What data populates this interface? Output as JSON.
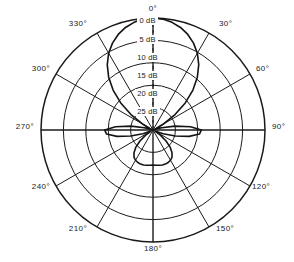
{
  "chart_data": {
    "type": "line",
    "subtype": "polar-radiation-pattern",
    "title": "",
    "xlabel": "",
    "ylabel": "",
    "grid": true,
    "legend": null,
    "center": {
      "x": 153,
      "y": 130
    },
    "outer_radius": 112,
    "angle_unit": "degrees",
    "angle_zero_position": "top",
    "angle_direction": "clockwise",
    "angle_ticks": [
      0,
      30,
      60,
      90,
      120,
      150,
      180,
      210,
      240,
      270,
      300,
      330
    ],
    "angle_tick_labels": [
      "0°",
      "30°",
      "60°",
      "90°",
      "120°",
      "150°",
      "180°",
      "210°",
      "240°",
      "270°",
      "300°",
      "330°"
    ],
    "radial_ticks_db": [
      0,
      5,
      10,
      15,
      20,
      25
    ],
    "radial_tick_labels": [
      "0 dB",
      "5 dB",
      "10 dB",
      "15 dB",
      "20 dB",
      "25 dB"
    ],
    "radial_scale_note": "0 dB at outer circle, 25 dB at center; value increases inward (attenuation below peak)",
    "rlim_db": [
      0,
      25
    ],
    "grid_circle_count": 6,
    "spoke_count": 12,
    "series": [
      {
        "name": "pattern",
        "angles": [
          0,
          5,
          10,
          15,
          20,
          25,
          30,
          35,
          40,
          45,
          50,
          55,
          60,
          65,
          70,
          75,
          80,
          85,
          90,
          95,
          100,
          105,
          110,
          115,
          120,
          125,
          130,
          135,
          140,
          145,
          150,
          155,
          160,
          165,
          170,
          175,
          180,
          185,
          190,
          195,
          200,
          205,
          210,
          215,
          220,
          225,
          230,
          235,
          240,
          245,
          250,
          255,
          260,
          265,
          270,
          275,
          280,
          285,
          290,
          295,
          300,
          305,
          310,
          315,
          320,
          325,
          330,
          335,
          340,
          345,
          350,
          355
        ],
        "values_db": [
          0.0,
          0.15,
          0.6,
          1.3,
          2.3,
          3.6,
          5.2,
          7.2,
          9.6,
          12.4,
          15.6,
          19.0,
          22.2,
          24.2,
          24.6,
          23.0,
          20.0,
          16.6,
          14.2,
          14.6,
          16.8,
          19.8,
          22.6,
          24.3,
          24.4,
          23.0,
          21.2,
          19.6,
          18.4,
          17.6,
          17.2,
          17.0,
          16.9,
          16.9,
          17.0,
          17.1,
          17.2,
          17.1,
          17.0,
          16.9,
          16.9,
          17.0,
          17.2,
          17.6,
          18.4,
          19.6,
          21.2,
          23.0,
          24.4,
          24.3,
          22.6,
          19.8,
          16.8,
          14.6,
          14.2,
          16.6,
          20.0,
          23.0,
          24.6,
          24.2,
          22.2,
          19.0,
          15.6,
          12.4,
          9.6,
          7.2,
          5.2,
          3.6,
          2.3,
          1.3,
          0.6,
          0.15
        ]
      }
    ],
    "features": {
      "main_lobe_direction_deg": 0,
      "main_lobe_peak_db": 0,
      "main_lobe_half_power_beamwidth_deg": 56,
      "side_lobe_directions_deg": [
        95,
        265
      ],
      "side_lobe_peak_db": 14.2,
      "back_lobe_direction_deg": 180,
      "back_lobe_peak_db": 17.2,
      "null_directions_deg": [
        70,
        120,
        240,
        290
      ]
    }
  },
  "angle_labels": [
    {
      "text": "0°",
      "x": 153,
      "y": 8,
      "anchor": "center"
    },
    {
      "text": "30°",
      "x": 219,
      "y": 23,
      "anchor": "left"
    },
    {
      "text": "60°",
      "x": 256,
      "y": 68,
      "anchor": "left"
    },
    {
      "text": "90°",
      "x": 272,
      "y": 126,
      "anchor": "left"
    },
    {
      "text": "120°",
      "x": 252,
      "y": 186,
      "anchor": "left"
    },
    {
      "text": "150°",
      "x": 216,
      "y": 228,
      "anchor": "left"
    },
    {
      "text": "180°",
      "x": 153,
      "y": 248,
      "anchor": "center"
    },
    {
      "text": "210°",
      "x": 87,
      "y": 228,
      "anchor": "right"
    },
    {
      "text": "240°",
      "x": 50,
      "y": 186,
      "anchor": "right"
    },
    {
      "text": "270°",
      "x": 34,
      "y": 126,
      "anchor": "right"
    },
    {
      "text": "300°",
      "x": 50,
      "y": 68,
      "anchor": "right"
    },
    {
      "text": "330°",
      "x": 87,
      "y": 23,
      "anchor": "right"
    }
  ],
  "radial_labels": [
    {
      "text": "0 dB",
      "y": 21
    },
    {
      "text": "5 dB",
      "y": 40
    },
    {
      "text": "10 dB",
      "y": 58
    },
    {
      "text": "15 dB",
      "y": 76
    },
    {
      "text": "20 dB",
      "y": 94
    },
    {
      "text": "25 dB",
      "y": 112
    }
  ],
  "colors": {
    "background": "#ffffff",
    "grid": "#1a1a1a",
    "curve": "#141414",
    "text": "#1a1a1a"
  }
}
